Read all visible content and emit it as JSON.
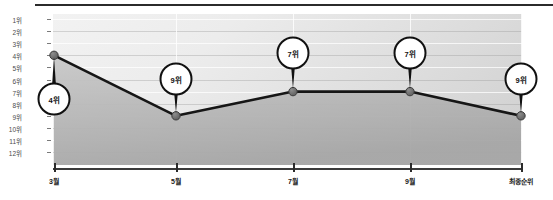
{
  "chart_data": {
    "type": "line",
    "title": "",
    "xlabel": "",
    "ylabel": "",
    "categories": [
      "3월",
      "5월",
      "7월",
      "9월",
      "최종순위"
    ],
    "values": [
      4,
      9,
      7,
      7,
      9
    ],
    "point_labels": [
      "4위",
      "9위",
      "7위",
      "7위",
      "9위"
    ],
    "ylim": [
      1,
      12
    ],
    "y_inverted": true,
    "ytick_labels": [
      "1위",
      "2위",
      "3위",
      "4위",
      "5위",
      "6위",
      "7위",
      "8위",
      "9위",
      "10위",
      "11위",
      "12위"
    ],
    "ytick_values": [
      1,
      2,
      3,
      4,
      5,
      6,
      7,
      8,
      9,
      10,
      11,
      12
    ],
    "grid": true,
    "legend": "none",
    "series": [
      {
        "name": "순위",
        "values": [
          4,
          9,
          7,
          7,
          9
        ]
      }
    ],
    "colors": {
      "line": "#1a1a1a",
      "marker": "#6e6e6e",
      "marker_edge": "#2b2b2b",
      "area_top": "#bdbdbd",
      "area_bottom": "#a8a8a8",
      "plot_bg_light": "#f2f2f2",
      "plot_bg_dark": "#cfcfcf",
      "axis": "#2b2b2b",
      "callout_bg": "#ffffff",
      "callout_border": "#111111",
      "tick_label": "#4b4b4b"
    }
  }
}
